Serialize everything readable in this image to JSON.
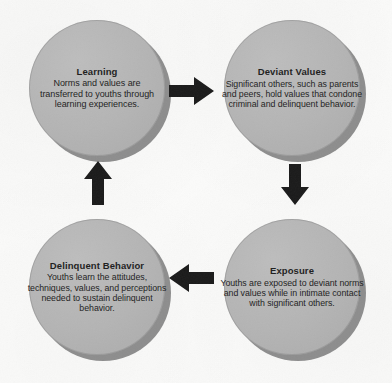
{
  "diagram": {
    "background_color": "#fbfbfa",
    "circle_fill_color": "#b4b4b4",
    "circle_shadow_color": "#8d8d8d",
    "arrow_color": "#1a1a1a",
    "text_color": "#1d1d1d"
  },
  "nodes": [
    {
      "id": "learning",
      "title": "Learning",
      "body": "Norms and values are transferred to youths through learning experiences.",
      "position": "top-left"
    },
    {
      "id": "deviant-values",
      "title": "Deviant Values",
      "body": "Significant others, such as parents and peers, hold values that condone criminal and delinquent behavior.",
      "position": "top-right"
    },
    {
      "id": "exposure",
      "title": "Exposure",
      "body": "Youths are exposed to deviant norms and values while in intimate contact with significant others.",
      "position": "bottom-right"
    },
    {
      "id": "delinquent-behavior",
      "title": "Delinquent Behavior",
      "body": "Youths learn the attitudes, techniques, values, and perceptions needed to sustain delinquent behavior.",
      "position": "bottom-left"
    }
  ],
  "arrows": [
    {
      "id": "top",
      "direction": "right",
      "from": "learning",
      "to": "deviant-values"
    },
    {
      "id": "right",
      "direction": "down",
      "from": "deviant-values",
      "to": "exposure"
    },
    {
      "id": "bottom",
      "direction": "left",
      "from": "exposure",
      "to": "delinquent-behavior"
    },
    {
      "id": "left",
      "direction": "up",
      "from": "delinquent-behavior",
      "to": "learning"
    }
  ]
}
